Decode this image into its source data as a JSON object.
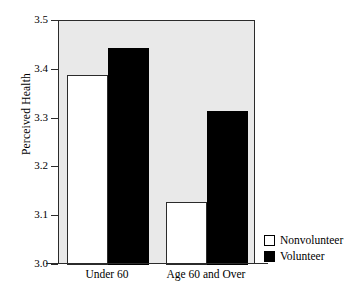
{
  "chart_data": {
    "type": "bar",
    "title": "",
    "subtitle": "",
    "xlabel": "",
    "ylabel": "Perceived Health",
    "categories": [
      "Under 60",
      "Age 60 and Over"
    ],
    "series": [
      {
        "name": "Nonvolunteer",
        "color": "#ffffff",
        "values": [
          3.39,
          3.13
        ]
      },
      {
        "name": "Volunteer",
        "color": "#000000",
        "values": [
          3.445,
          3.315
        ]
      }
    ],
    "ylim": [
      3.0,
      3.5
    ],
    "yticks": [
      "3.0",
      "3.1",
      "3.2",
      "3.3",
      "3.4",
      "3.5"
    ],
    "ytick_values": [
      3.0,
      3.1,
      3.2,
      3.3,
      3.4,
      3.5
    ],
    "grid": false,
    "legend_position": "right-bottom",
    "plot_background": "#e9e9e9",
    "figure_background": "#ffffff",
    "axis_color": "#2b2b2b"
  },
  "legend": {
    "entries": [
      {
        "label": "Nonvolunteer",
        "swatch": "white"
      },
      {
        "label": "Volunteer",
        "swatch": "black"
      }
    ]
  }
}
